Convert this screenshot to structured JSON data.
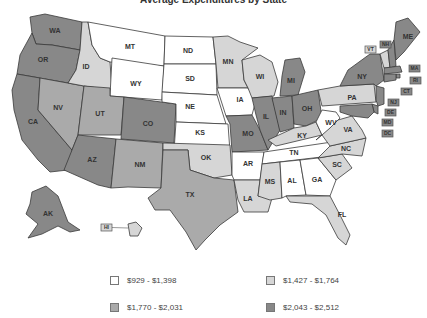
{
  "title": "Average Expenditures by State",
  "legend": [
    {
      "label": "$929 - $1,398",
      "color": "#ffffff"
    },
    {
      "label": "$1,427 - $1,764",
      "color": "#d6d6d6"
    },
    {
      "label": "$1,770 - $2,031",
      "color": "#aaaaaa"
    },
    {
      "label": "$2,043 - $2,512",
      "color": "#888888"
    }
  ],
  "states": {
    "WA": 3,
    "OR": 3,
    "CA": 3,
    "NV": 2,
    "ID": 1,
    "MT": 0,
    "WY": 0,
    "UT": 2,
    "AZ": 3,
    "CO": 3,
    "NM": 2,
    "ND": 0,
    "SD": 0,
    "NE": 0,
    "KS": 0,
    "OK": 1,
    "TX": 2,
    "MN": 1,
    "IA": 0,
    "MO": 3,
    "AR": 0,
    "LA": 1,
    "WI": 1,
    "IL": 3,
    "MI": 3,
    "IN": 3,
    "OH": 3,
    "KY": 1,
    "TN": 0,
    "MS": 1,
    "AL": 0,
    "GA": 0,
    "FL": 1,
    "SC": 1,
    "NC": 1,
    "VA": 1,
    "WV": 0,
    "PA": 1,
    "NY": 3,
    "ME": 3,
    "VT": 1,
    "NH": 3,
    "MA": 3,
    "RI": 3,
    "CT": 3,
    "NJ": 3,
    "DE": 3,
    "MD": 3,
    "DC": 3,
    "AK": 3,
    "HI": 1
  },
  "labels": {
    "WA": "WA",
    "OR": "OR",
    "CA": "CA",
    "NV": "NV",
    "ID": "ID",
    "MT": "MT",
    "WY": "WY",
    "UT": "UT",
    "AZ": "AZ",
    "CO": "CO",
    "NM": "NM",
    "ND": "ND",
    "SD": "SD",
    "NE": "NE",
    "KS": "KS",
    "OK": "OK",
    "TX": "TX",
    "MN": "MN",
    "IA": "IA",
    "MO": "MO",
    "AR": "AR",
    "LA": "LA",
    "WI": "WI",
    "IL": "IL",
    "MI": "MI",
    "IN": "IN",
    "OH": "OH",
    "KY": "KY",
    "TN": "TN",
    "MS": "MS",
    "AL": "AL",
    "GA": "GA",
    "FL": "FL",
    "SC": "SC",
    "NC": "NC",
    "VA": "VA",
    "WV": "WV",
    "PA": "PA",
    "NY": "NY",
    "ME": "ME",
    "VT": "VT",
    "NH": "NH",
    "MA": "MA",
    "RI": "RI",
    "CT": "CT",
    "NJ": "NJ",
    "DE": "DE",
    "MD": "MD",
    "DC": "DC",
    "AK": "AK",
    "HI": "HI"
  }
}
